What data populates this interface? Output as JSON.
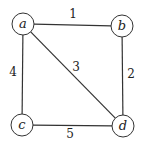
{
  "graph": {
    "nodes": [
      {
        "id": "a",
        "label": "a",
        "x": 23,
        "y": 24
      },
      {
        "id": "b",
        "label": "b",
        "x": 122,
        "y": 26
      },
      {
        "id": "c",
        "label": "c",
        "x": 22,
        "y": 125
      },
      {
        "id": "d",
        "label": "d",
        "x": 123,
        "y": 126
      }
    ],
    "edges": [
      {
        "from": "a",
        "to": "b",
        "weight": "1",
        "label_x": 73,
        "label_y": 18
      },
      {
        "from": "b",
        "to": "d",
        "weight": "2",
        "label_x": 131,
        "label_y": 78
      },
      {
        "from": "a",
        "to": "d",
        "weight": "3",
        "label_x": 76,
        "label_y": 71
      },
      {
        "from": "a",
        "to": "c",
        "weight": "4",
        "label_x": 13,
        "label_y": 76
      },
      {
        "from": "c",
        "to": "d",
        "weight": "5",
        "label_x": 70,
        "label_y": 138
      }
    ],
    "node_radius": 11
  }
}
